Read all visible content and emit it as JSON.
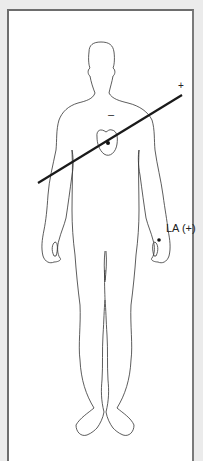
{
  "diagram": {
    "type": "ecg-lead-placement",
    "lead_axis": {
      "positive_label": "+",
      "negative_label": "–",
      "line_color": "#1a1a1a"
    },
    "electrode": {
      "label": "LA (+)",
      "dot_color": "#111111"
    },
    "heart_marker": {
      "dot_color": "#111111"
    },
    "colors": {
      "background": "#ebebeb",
      "panel": "#ffffff",
      "panel_border": "#6d6d6d",
      "outline": "#333333"
    }
  }
}
